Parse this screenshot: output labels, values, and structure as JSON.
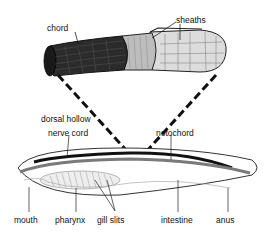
{
  "diagram": {
    "labels": {
      "chord": "chord",
      "sheaths": "sheaths",
      "dorsal_hollow": "dorsal hollow",
      "nerve_cord": "nerve cord",
      "notochord": "notochord",
      "mouth": "mouth",
      "pharynx": "pharynx",
      "gill_slits": "gill slits",
      "intestine": "intestine",
      "anus": "anus"
    },
    "colors": {
      "background": "#ffffff",
      "nerve_cord": "#111111",
      "notochord": "#7a7a7a",
      "outline": "#333333",
      "chord_fill": "#2b2b2b",
      "sheath_fill": "#d8d8d8"
    }
  }
}
